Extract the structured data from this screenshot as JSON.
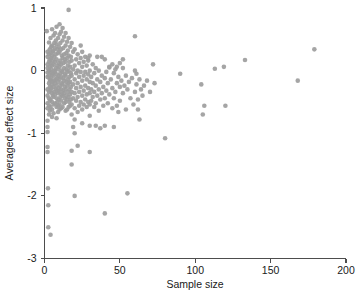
{
  "chart_data": {
    "type": "scatter",
    "title": "",
    "xlabel": "Sample size",
    "ylabel": "Averaged effect size",
    "xlim": [
      0,
      200
    ],
    "ylim": [
      -3,
      1
    ],
    "xticks": [
      0,
      50,
      100,
      150,
      200
    ],
    "yticks": [
      1,
      0,
      -1,
      -2,
      -3
    ],
    "xticklabels": [
      "0",
      "50",
      "100",
      "150",
      "200"
    ],
    "yticklabels": [
      "1",
      "0",
      "-1",
      "-2",
      "-3"
    ],
    "grid": false,
    "legend": null,
    "marker": {
      "shape": "circle",
      "color": "#9d9d9d",
      "size": 2.3,
      "opacity": 0.92
    },
    "n_points": 232,
    "points": [
      [
        1.5,
        0.63
      ],
      [
        2.0,
        0.3
      ],
      [
        2.0,
        0.22
      ],
      [
        2.0,
        0.1
      ],
      [
        2.0,
        0.04
      ],
      [
        2.0,
        -0.03
      ],
      [
        2.0,
        -0.1
      ],
      [
        2.0,
        -0.3
      ],
      [
        2.0,
        -0.4
      ],
      [
        2.0,
        -0.52
      ],
      [
        2.0,
        -0.6
      ],
      [
        2.0,
        -0.8
      ],
      [
        2.0,
        -0.9
      ],
      [
        2.0,
        -0.98
      ],
      [
        2.0,
        -1.22
      ],
      [
        2.0,
        -1.3
      ],
      [
        2.3,
        -1.88
      ],
      [
        2.5,
        -2.15
      ],
      [
        2.5,
        -2.5
      ],
      [
        4.0,
        -2.62
      ],
      [
        3.0,
        0.45
      ],
      [
        3.0,
        0.26
      ],
      [
        3.0,
        0.14
      ],
      [
        3.0,
        0.0
      ],
      [
        3.0,
        -0.08
      ],
      [
        3.0,
        -0.2
      ],
      [
        3.0,
        -0.34
      ],
      [
        3.0,
        -0.44
      ],
      [
        3.0,
        -0.56
      ],
      [
        3.0,
        -0.7
      ],
      [
        3.5,
        0.34
      ],
      [
        3.5,
        0.18
      ],
      [
        3.5,
        0.06
      ],
      [
        3.5,
        -0.14
      ],
      [
        3.5,
        -0.26
      ],
      [
        3.5,
        -0.48
      ],
      [
        3.5,
        -0.64
      ],
      [
        4.0,
        0.52
      ],
      [
        4.0,
        0.28
      ],
      [
        4.0,
        0.12
      ],
      [
        4.0,
        -0.02
      ],
      [
        4.0,
        -0.16
      ],
      [
        4.0,
        -0.32
      ],
      [
        4.0,
        -0.46
      ],
      [
        4.0,
        -0.58
      ],
      [
        4.5,
        0.38
      ],
      [
        4.5,
        0.2
      ],
      [
        4.5,
        0.02
      ],
      [
        4.5,
        -0.12
      ],
      [
        4.5,
        -0.28
      ],
      [
        5.0,
        0.66
      ],
      [
        5.0,
        0.4
      ],
      [
        5.0,
        0.24
      ],
      [
        5.0,
        0.08
      ],
      [
        5.0,
        -0.06
      ],
      [
        5.0,
        -0.22
      ],
      [
        5.0,
        -0.36
      ],
      [
        5.0,
        -0.5
      ],
      [
        5.0,
        -0.62
      ],
      [
        5.0,
        -0.74
      ],
      [
        5.5,
        0.3
      ],
      [
        5.5,
        0.16
      ],
      [
        5.5,
        -0.04
      ],
      [
        5.5,
        -0.18
      ],
      [
        5.5,
        -0.4
      ],
      [
        6.0,
        0.56
      ],
      [
        6.0,
        0.32
      ],
      [
        6.0,
        0.1
      ],
      [
        6.0,
        -0.08
      ],
      [
        6.0,
        -0.26
      ],
      [
        6.0,
        -0.42
      ],
      [
        6.0,
        -0.54
      ],
      [
        6.0,
        -0.68
      ],
      [
        6.5,
        0.44
      ],
      [
        6.5,
        0.22
      ],
      [
        6.5,
        0.0
      ],
      [
        6.5,
        -0.16
      ],
      [
        6.5,
        -0.34
      ],
      [
        7.0,
        0.6
      ],
      [
        7.0,
        0.36
      ],
      [
        7.0,
        0.14
      ],
      [
        7.0,
        -0.02
      ],
      [
        7.0,
        -0.2
      ],
      [
        7.0,
        -0.38
      ],
      [
        7.0,
        -0.52
      ],
      [
        7.5,
        0.48
      ],
      [
        7.5,
        0.26
      ],
      [
        7.5,
        0.04
      ],
      [
        7.5,
        -0.14
      ],
      [
        7.5,
        -0.3
      ],
      [
        8.0,
        0.7
      ],
      [
        8.0,
        0.42
      ],
      [
        8.0,
        0.18
      ],
      [
        8.0,
        -0.06
      ],
      [
        8.0,
        -0.24
      ],
      [
        8.0,
        -0.44
      ],
      [
        8.0,
        -0.58
      ],
      [
        8.0,
        -0.76
      ],
      [
        8.5,
        0.34
      ],
      [
        8.5,
        0.08
      ],
      [
        8.5,
        -0.12
      ],
      [
        8.5,
        -0.32
      ],
      [
        8.5,
        -0.5
      ],
      [
        9.0,
        0.52
      ],
      [
        9.0,
        0.28
      ],
      [
        9.0,
        0.02
      ],
      [
        9.0,
        -0.18
      ],
      [
        9.0,
        -0.36
      ],
      [
        9.0,
        -0.56
      ],
      [
        9.0,
        -0.66
      ],
      [
        9.5,
        0.38
      ],
      [
        9.5,
        0.12
      ],
      [
        9.5,
        -0.08
      ],
      [
        9.5,
        -0.28
      ],
      [
        9.5,
        -0.46
      ],
      [
        10.0,
        0.58
      ],
      [
        10.0,
        0.3
      ],
      [
        10.0,
        0.06
      ],
      [
        10.0,
        -0.14
      ],
      [
        10.0,
        -0.34
      ],
      [
        10.0,
        -0.54
      ],
      [
        10.0,
        -0.62
      ],
      [
        10.5,
        0.44
      ],
      [
        10.5,
        0.16
      ],
      [
        10.5,
        -0.04
      ],
      [
        10.5,
        -0.24
      ],
      [
        10.5,
        -0.42
      ],
      [
        11.0,
        0.62
      ],
      [
        11.0,
        0.34
      ],
      [
        11.0,
        0.1
      ],
      [
        11.0,
        -0.1
      ],
      [
        11.0,
        -0.3
      ],
      [
        11.0,
        -0.48
      ],
      [
        11.0,
        -0.6
      ],
      [
        11.5,
        0.24
      ],
      [
        11.5,
        0.0
      ],
      [
        11.5,
        -0.2
      ],
      [
        11.5,
        -0.38
      ],
      [
        12.0,
        0.48
      ],
      [
        12.0,
        0.2
      ],
      [
        12.0,
        -0.02
      ],
      [
        12.0,
        -0.22
      ],
      [
        12.0,
        -0.4
      ],
      [
        12.0,
        -0.58
      ],
      [
        12.5,
        0.36
      ],
      [
        12.5,
        0.12
      ],
      [
        12.5,
        -0.12
      ],
      [
        12.5,
        -0.32
      ],
      [
        13.0,
        0.54
      ],
      [
        13.0,
        0.26
      ],
      [
        13.0,
        0.04
      ],
      [
        13.0,
        -0.16
      ],
      [
        13.0,
        -0.36
      ],
      [
        13.0,
        -0.52
      ],
      [
        13.5,
        0.18
      ],
      [
        13.5,
        -0.06
      ],
      [
        13.5,
        -0.26
      ],
      [
        13.5,
        -0.44
      ],
      [
        14.0,
        0.4
      ],
      [
        14.0,
        0.14
      ],
      [
        14.0,
        -0.08
      ],
      [
        14.0,
        -0.3
      ],
      [
        14.0,
        -0.5
      ],
      [
        14.0,
        -0.64
      ],
      [
        14.5,
        0.28
      ],
      [
        14.5,
        0.02
      ],
      [
        14.5,
        -0.18
      ],
      [
        14.5,
        -0.4
      ],
      [
        15.0,
        0.46
      ],
      [
        15.0,
        0.2
      ],
      [
        15.0,
        -0.02
      ],
      [
        15.0,
        -0.24
      ],
      [
        15.0,
        -0.46
      ],
      [
        15.0,
        -0.62
      ],
      [
        15.5,
        0.32
      ],
      [
        15.5,
        0.08
      ],
      [
        15.5,
        -0.14
      ],
      [
        15.5,
        -0.34
      ],
      [
        16.0,
        0.97
      ],
      [
        16.0,
        0.52
      ],
      [
        16.0,
        0.24
      ],
      [
        16.0,
        0.0
      ],
      [
        16.0,
        -0.2
      ],
      [
        16.0,
        -0.42
      ],
      [
        16.0,
        -0.58
      ],
      [
        16.5,
        0.14
      ],
      [
        16.5,
        -0.1
      ],
      [
        16.5,
        -0.3
      ],
      [
        16.5,
        -0.5
      ],
      [
        17.0,
        0.38
      ],
      [
        17.0,
        0.06
      ],
      [
        17.0,
        -0.18
      ],
      [
        17.0,
        -0.38
      ],
      [
        17.0,
        -0.56
      ],
      [
        17.5,
        0.22
      ],
      [
        17.5,
        -0.04
      ],
      [
        17.5,
        -0.26
      ],
      [
        17.5,
        -0.46
      ],
      [
        18.0,
        0.44
      ],
      [
        18.0,
        0.16
      ],
      [
        18.0,
        -0.08
      ],
      [
        18.0,
        -0.34
      ],
      [
        18.0,
        -0.54
      ],
      [
        18.0,
        -0.7
      ],
      [
        19.0,
        0.3
      ],
      [
        19.0,
        0.02
      ],
      [
        19.0,
        -0.22
      ],
      [
        19.0,
        -0.44
      ],
      [
        19.0,
        -0.9
      ],
      [
        20.0,
        0.34
      ],
      [
        20.0,
        0.08
      ],
      [
        20.0,
        -0.14
      ],
      [
        20.0,
        -0.36
      ],
      [
        20.0,
        -0.6
      ],
      [
        20.0,
        -0.78
      ],
      [
        20.0,
        -1.0
      ],
      [
        21.0,
        0.18
      ],
      [
        21.0,
        -0.04
      ],
      [
        21.0,
        -0.28
      ],
      [
        21.0,
        -0.48
      ],
      [
        22.0,
        0.26
      ],
      [
        22.0,
        0.0
      ],
      [
        22.0,
        -0.2
      ],
      [
        22.0,
        -0.42
      ],
      [
        22.0,
        -0.66
      ],
      [
        23.0,
        0.12
      ],
      [
        23.0,
        -0.1
      ],
      [
        23.0,
        -0.34
      ],
      [
        23.0,
        -0.56
      ],
      [
        24.0,
        0.2
      ],
      [
        24.0,
        -0.02
      ],
      [
        24.0,
        -0.26
      ],
      [
        24.0,
        -0.5
      ],
      [
        25.0,
        0.3
      ],
      [
        25.0,
        0.06
      ],
      [
        25.0,
        -0.16
      ],
      [
        25.0,
        -0.4
      ],
      [
        25.0,
        -0.62
      ],
      [
        25.0,
        -0.84
      ],
      [
        26.0,
        0.14
      ],
      [
        26.0,
        -0.08
      ],
      [
        26.0,
        -0.32
      ],
      [
        26.0,
        -0.54
      ],
      [
        27.0,
        0.22
      ],
      [
        27.0,
        -0.02
      ],
      [
        27.0,
        -0.24
      ],
      [
        27.0,
        -0.46
      ],
      [
        28.0,
        0.08
      ],
      [
        28.0,
        -0.14
      ],
      [
        28.0,
        -0.38
      ],
      [
        28.0,
        -0.58
      ],
      [
        29.0,
        0.16
      ],
      [
        29.0,
        -0.06
      ],
      [
        29.0,
        -0.28
      ],
      [
        29.0,
        -0.5
      ],
      [
        30.0,
        0.24
      ],
      [
        30.0,
        0.0
      ],
      [
        30.0,
        -0.18
      ],
      [
        30.0,
        -0.36
      ],
      [
        30.0,
        -0.54
      ],
      [
        30.0,
        -0.72
      ],
      [
        30.0,
        -0.88
      ],
      [
        31.0,
        -0.1
      ],
      [
        31.0,
        -0.3
      ],
      [
        31.0,
        -0.48
      ],
      [
        32.0,
        0.1
      ],
      [
        32.0,
        -0.2
      ],
      [
        32.0,
        -0.42
      ],
      [
        33.0,
        -0.04
      ],
      [
        33.0,
        -0.34
      ],
      [
        33.0,
        -0.58
      ],
      [
        34.0,
        0.04
      ],
      [
        34.0,
        -0.24
      ],
      [
        34.0,
        -0.52
      ],
      [
        35.0,
        -0.14
      ],
      [
        35.0,
        -0.4
      ],
      [
        36.0,
        0.0
      ],
      [
        36.0,
        -0.3
      ],
      [
        36.0,
        -0.64
      ],
      [
        37.0,
        -0.18
      ],
      [
        37.0,
        -0.46
      ],
      [
        38.0,
        0.22
      ],
      [
        38.0,
        -0.08
      ],
      [
        38.0,
        -0.36
      ],
      [
        39.0,
        -0.26
      ],
      [
        39.0,
        -0.56
      ],
      [
        40.0,
        0.18
      ],
      [
        40.0,
        -0.12
      ],
      [
        40.0,
        -0.44
      ],
      [
        40.0,
        -0.88
      ],
      [
        41.0,
        -0.02
      ],
      [
        41.0,
        -0.32
      ],
      [
        42.0,
        -0.2
      ],
      [
        42.0,
        -0.52
      ],
      [
        43.0,
        0.06
      ],
      [
        43.0,
        -0.38
      ],
      [
        44.0,
        -0.14
      ],
      [
        45.0,
        0.1
      ],
      [
        45.0,
        -0.28
      ],
      [
        45.0,
        -0.6
      ],
      [
        46.0,
        -0.04
      ],
      [
        46.0,
        -0.44
      ],
      [
        47.0,
        0.02
      ],
      [
        47.0,
        -0.34
      ],
      [
        48.0,
        0.06
      ],
      [
        48.0,
        -0.2
      ],
      [
        48.0,
        -0.56
      ],
      [
        49.0,
        -0.1
      ],
      [
        49.0,
        -0.66
      ],
      [
        50.0,
        0.12
      ],
      [
        50.0,
        -0.26
      ],
      [
        50.0,
        -0.48
      ],
      [
        51.0,
        -0.16
      ],
      [
        52.0,
        0.04
      ],
      [
        52.0,
        -0.36
      ],
      [
        53.0,
        -0.24
      ],
      [
        54.0,
        -0.08
      ],
      [
        54.0,
        -0.62
      ],
      [
        55.0,
        -0.3
      ],
      [
        56.0,
        -0.18
      ],
      [
        57.0,
        -0.44
      ],
      [
        58.0,
        -0.12
      ],
      [
        59.0,
        -0.54
      ],
      [
        60.0,
        0.0
      ],
      [
        60.0,
        -0.34
      ],
      [
        61.0,
        -0.22
      ],
      [
        62.0,
        -0.46
      ],
      [
        62.0,
        -0.62
      ],
      [
        63.0,
        -0.14
      ],
      [
        63.0,
        -0.78
      ],
      [
        64.0,
        -0.3
      ],
      [
        65.0,
        -0.4
      ],
      [
        66.0,
        -0.24
      ],
      [
        68.0,
        -0.16
      ],
      [
        70.0,
        -0.34
      ],
      [
        72.0,
        0.1
      ],
      [
        73.0,
        -0.2
      ],
      [
        30.0,
        -1.3
      ],
      [
        22.0,
        -1.2
      ],
      [
        18.0,
        -1.28
      ],
      [
        18.0,
        -1.5
      ],
      [
        20.0,
        -2.0
      ],
      [
        40.0,
        -2.28
      ],
      [
        55.0,
        -1.96
      ],
      [
        46.0,
        -0.9
      ],
      [
        34.0,
        -0.88
      ],
      [
        37.0,
        -0.92
      ],
      [
        80.0,
        -1.08
      ],
      [
        90.0,
        -0.05
      ],
      [
        104.0,
        -0.22
      ],
      [
        106.0,
        -0.56
      ],
      [
        105.0,
        -0.7
      ],
      [
        113.0,
        0.03
      ],
      [
        119.0,
        0.06
      ],
      [
        120.0,
        -0.56
      ],
      [
        133.0,
        0.17
      ],
      [
        168.0,
        -0.16
      ],
      [
        179.0,
        0.34
      ],
      [
        24.0,
        0.4
      ],
      [
        29.0,
        0.2
      ],
      [
        35.0,
        0.22
      ],
      [
        43.0,
        0.05
      ],
      [
        52.0,
        0.18
      ],
      [
        60.0,
        0.55
      ],
      [
        61.0,
        -0.05
      ],
      [
        10.0,
        0.74
      ],
      [
        12.0,
        0.68
      ],
      [
        14.0,
        0.6
      ]
    ]
  },
  "axes": {
    "x_title": "Sample size",
    "y_title": "Averaged effect size"
  }
}
